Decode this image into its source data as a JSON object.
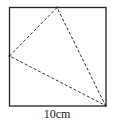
{
  "figure": {
    "type": "geometry",
    "square": {
      "x": 9,
      "y": 7,
      "width": 97,
      "height": 99,
      "stroke": "#222222"
    },
    "triangle": {
      "vertices": [
        [
          57,
          7
        ],
        [
          9,
          56
        ],
        [
          106,
          106
        ]
      ],
      "stroke": "#333333",
      "dash": "3,2"
    },
    "dimension_label": "10cm"
  }
}
